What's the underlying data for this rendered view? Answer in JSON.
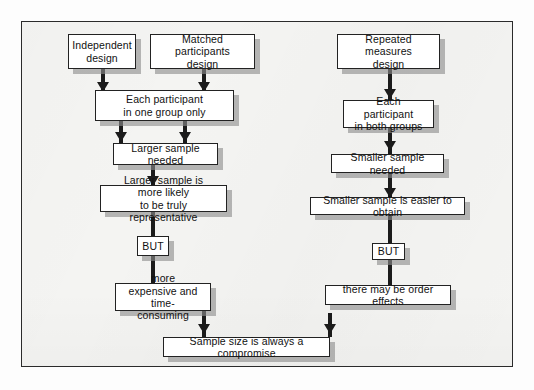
{
  "diagram": {
    "frame": {
      "border_color": "#2b2b2b",
      "background": "#f4f4f2"
    },
    "node_style": {
      "fill": "#ffffff",
      "border": "#222222",
      "shadow": "#8c8c8c"
    },
    "connector_color": "#1b1b1b",
    "nodes": {
      "independent_design": "Independent\ndesign",
      "independent_design_line1": "Independent",
      "independent_design_line2": "design",
      "matched_design_line1": "Matched participants",
      "matched_design_line2": "design",
      "repeated_design_line1": "Repeated measures",
      "repeated_design_line2": "design",
      "each_one_group_line1": "Each participant",
      "each_one_group_line2": "in one group only",
      "each_both_groups_line1": "Each participant",
      "each_both_groups_line2": "in both groups",
      "larger_sample_needed": "Larger sample needed",
      "smaller_sample_needed": "Smaller sample needed",
      "larger_representative_line1": "Larger sample is more likely",
      "larger_representative_line2": "to be truly representative",
      "smaller_easier": "Smaller sample is easier to obtain",
      "but_left": "BUT",
      "but_right": "BUT",
      "more_expensive_line1": "more expensive and",
      "more_expensive_line2": "time-consuming",
      "order_effects": "there may be order effects",
      "compromise": "Sample size is always a compromise"
    }
  }
}
